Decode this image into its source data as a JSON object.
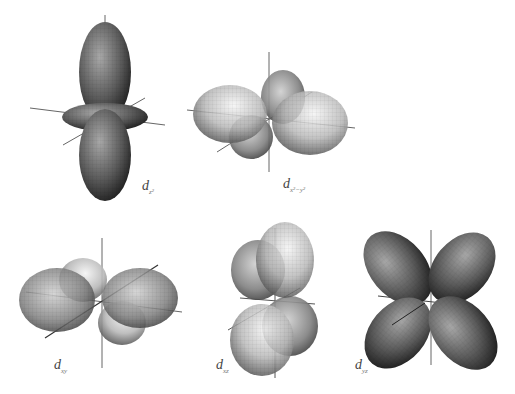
{
  "orbitals": [
    {
      "id": "dz2",
      "label_main": "d",
      "label_sub": "z²"
    },
    {
      "id": "dx2y2",
      "label_main": "d",
      "label_sub": "x²−y²"
    },
    {
      "id": "dxy",
      "label_main": "d",
      "label_sub": "xy"
    },
    {
      "id": "dxz",
      "label_main": "d",
      "label_sub": "xz"
    },
    {
      "id": "dyz",
      "label_main": "d",
      "label_sub": "yz"
    }
  ],
  "colors": {
    "lobe_dark": "#2e2e2e",
    "lobe_mid": "#7a7a7a",
    "lobe_light": "#d9d9d9",
    "axis": "#555555"
  }
}
